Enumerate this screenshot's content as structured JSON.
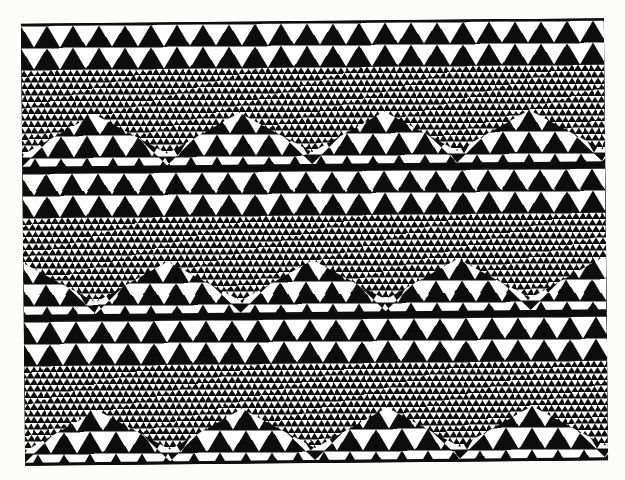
{
  "artwork": {
    "title": "Geometric triangle tessellation textile print",
    "medium": "printed cloth / tapa pattern",
    "description": "Monochrome repeating pattern of nested white triangles on black forming zigzag chevron bands at two scales",
    "background_color": "#fcfcfa",
    "ink_color": "#0d0d0d",
    "figure_color": "#ffffff",
    "panel": {
      "left": 23,
      "top": 21,
      "width": 583,
      "height": 442,
      "rotation_degrees": -0.55
    },
    "structure": {
      "band_count": 3,
      "band_height": 146,
      "chevron_peaks_per_band": 4,
      "chevron_period": 145,
      "coarse_triangle_width": 26,
      "coarse_triangle_height": 21,
      "fine_triangle_width": 6.6,
      "fine_triangle_height": 5.3
    },
    "bands": [
      {
        "name": "band-top",
        "top": 0,
        "header_rows": 2,
        "header_style": "coarse-down",
        "phase": 0,
        "upper_fill": "coarse-down",
        "lower_fill": "fine"
      },
      {
        "name": "band-middle",
        "top": 148,
        "header_rows": 2,
        "header_style": "coarse-down",
        "phase": 72,
        "upper_fill": "coarse-down",
        "lower_fill": "fine"
      },
      {
        "name": "band-bottom",
        "top": 296,
        "header_rows": 2,
        "header_style": "coarse-down",
        "phase": 0,
        "upper_fill": "coarse-down",
        "lower_fill": "fine"
      }
    ]
  }
}
